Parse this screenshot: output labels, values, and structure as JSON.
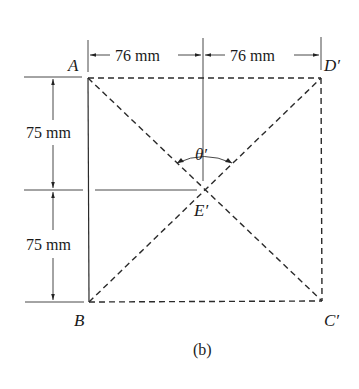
{
  "figure": {
    "caption": "(b)",
    "points": {
      "A": "A",
      "B": "B",
      "C": "C′",
      "D": "D′",
      "E": "E′"
    },
    "angle_label": "θ′",
    "dimensions": {
      "top_left": "76 mm",
      "top_right": "76 mm",
      "left_upper": "75 mm",
      "left_lower": "75 mm"
    },
    "colors": {
      "line": "#2a2a2a",
      "background": "#ffffff"
    }
  }
}
